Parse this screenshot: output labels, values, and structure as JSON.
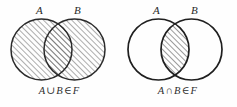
{
  "figure": {
    "background_color": "#fefefe",
    "ink_color": "#2a2a2a",
    "hatch_color": "#4a4a4a",
    "panels": [
      {
        "id": "union",
        "set_a_label": "A",
        "set_b_label": "B",
        "caption": {
          "left_operand": "A",
          "operator": "∪",
          "right_operand": "B",
          "relation": "∈",
          "family": "F",
          "full_text": "A ∪ B ∈ F"
        },
        "shaded_region": "union",
        "hatch_angle_degrees": 45,
        "circle_a": {
          "cx": 41.5,
          "cy": 49.5,
          "r": 30.5
        },
        "circle_b": {
          "cx": 74.5,
          "cy": 49.5,
          "r": 30.5
        }
      },
      {
        "id": "intersection",
        "set_a_label": "A",
        "set_b_label": "B",
        "caption": {
          "left_operand": "A",
          "operator": "∩",
          "right_operand": "B",
          "relation": "∈",
          "family": "F",
          "full_text": "A ∩ B ∈ F"
        },
        "shaded_region": "intersection",
        "hatch_angle_degrees": 45,
        "circle_a": {
          "cx": 40.5,
          "cy": 49.5,
          "r": 30.5
        },
        "circle_b": {
          "cx": 73.5,
          "cy": 49.5,
          "r": 30.5
        }
      }
    ]
  }
}
